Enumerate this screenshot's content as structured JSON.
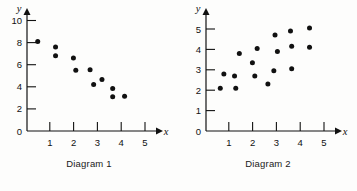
{
  "figure": {
    "background_color": "#fdfdfc",
    "ink_color": "#111111",
    "note": ""
  },
  "panels": [
    {
      "id": "diagram-1",
      "caption": "Diagram 1",
      "x_axis_label": "x",
      "y_axis_label": "y",
      "x_ticks": [
        "1",
        "2",
        "3",
        "4",
        "5"
      ],
      "y_ticks": [
        "0",
        "2",
        "4",
        "6",
        "8",
        "10"
      ]
    },
    {
      "id": "diagram-2",
      "caption": "Diagram 2",
      "x_axis_label": "x",
      "y_axis_label": "y",
      "x_ticks": [
        "1",
        "2",
        "3",
        "4",
        "5"
      ],
      "y_ticks": [
        "0",
        "1",
        "2",
        "3",
        "4",
        "5"
      ]
    }
  ],
  "chart_data": [
    {
      "type": "scatter",
      "title": "Diagram 1",
      "xlabel": "x",
      "ylabel": "y",
      "xlim": [
        0,
        5.6
      ],
      "ylim": [
        0,
        10.6
      ],
      "xticks": [
        1,
        2,
        3,
        4,
        5
      ],
      "yticks": [
        0,
        2,
        4,
        6,
        8,
        10
      ],
      "grid": false,
      "legend": "none",
      "correlation": "negative",
      "points": [
        {
          "x": 0.45,
          "y": 8.1
        },
        {
          "x": 1.2,
          "y": 7.6
        },
        {
          "x": 1.2,
          "y": 6.8
        },
        {
          "x": 1.95,
          "y": 6.6
        },
        {
          "x": 2.05,
          "y": 5.5
        },
        {
          "x": 2.65,
          "y": 5.55
        },
        {
          "x": 2.8,
          "y": 4.2
        },
        {
          "x": 3.15,
          "y": 4.65
        },
        {
          "x": 3.6,
          "y": 3.85
        },
        {
          "x": 3.6,
          "y": 3.1
        },
        {
          "x": 4.1,
          "y": 3.15
        }
      ]
    },
    {
      "type": "scatter",
      "title": "Diagram 2",
      "xlabel": "x",
      "ylabel": "y",
      "xlim": [
        0,
        5.6
      ],
      "ylim": [
        0,
        5.6
      ],
      "xticks": [
        1,
        2,
        3,
        4,
        5
      ],
      "yticks": [
        0,
        1,
        2,
        3,
        4,
        5
      ],
      "grid": false,
      "legend": "none",
      "correlation": "positive",
      "points": [
        {
          "x": 0.6,
          "y": 2.1
        },
        {
          "x": 0.75,
          "y": 2.8
        },
        {
          "x": 1.2,
          "y": 2.7
        },
        {
          "x": 1.25,
          "y": 2.1
        },
        {
          "x": 1.4,
          "y": 3.8
        },
        {
          "x": 1.95,
          "y": 3.35
        },
        {
          "x": 2.05,
          "y": 2.7
        },
        {
          "x": 2.15,
          "y": 4.05
        },
        {
          "x": 2.6,
          "y": 2.3
        },
        {
          "x": 2.85,
          "y": 2.95
        },
        {
          "x": 2.9,
          "y": 4.7
        },
        {
          "x": 3.0,
          "y": 3.9
        },
        {
          "x": 3.55,
          "y": 4.9
        },
        {
          "x": 3.6,
          "y": 4.15
        },
        {
          "x": 3.6,
          "y": 3.05
        },
        {
          "x": 4.35,
          "y": 5.05
        },
        {
          "x": 4.35,
          "y": 4.1
        }
      ]
    }
  ]
}
